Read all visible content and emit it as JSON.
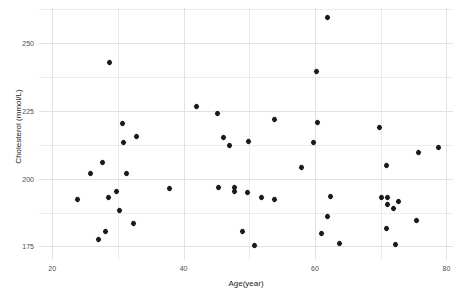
{
  "chart_data": {
    "type": "scatter",
    "title": "",
    "xlabel": "Age(year)",
    "ylabel": "Cholesterol (mmol/L)",
    "xlim": [
      18,
      81
    ],
    "ylim": [
      170,
      263
    ],
    "xticks": [
      20,
      40,
      60,
      80
    ],
    "yticks": [
      175,
      200,
      225,
      250
    ],
    "xticklabels": [
      "20",
      "40",
      "60",
      "80"
    ],
    "yticklabels": [
      "175",
      "200",
      "225",
      "250"
    ],
    "xminor": [
      30,
      50,
      70
    ],
    "yminor": [
      187.5,
      212.5,
      237.5,
      262.5
    ],
    "grid": true,
    "legend": false,
    "marker": "diamond",
    "marker_color": "#1a1a1a",
    "marker_size": 5,
    "series": [
      {
        "name": "patients",
        "points": [
          {
            "x": 28.8,
            "y": 242.8
          },
          {
            "x": 23.9,
            "y": 192.5
          },
          {
            "x": 25.8,
            "y": 201.8
          },
          {
            "x": 27.7,
            "y": 205.8
          },
          {
            "x": 27.1,
            "y": 177.5
          },
          {
            "x": 28.1,
            "y": 180.4
          },
          {
            "x": 28.5,
            "y": 192.9
          },
          {
            "x": 29.8,
            "y": 195.2
          },
          {
            "x": 30.2,
            "y": 188.1
          },
          {
            "x": 30.7,
            "y": 220.2
          },
          {
            "x": 30.9,
            "y": 213.3
          },
          {
            "x": 31.3,
            "y": 201.8
          },
          {
            "x": 32.4,
            "y": 183.3
          },
          {
            "x": 32.8,
            "y": 215.6
          },
          {
            "x": 37.8,
            "y": 196.4
          },
          {
            "x": 42.0,
            "y": 226.6
          },
          {
            "x": 45.2,
            "y": 224.2
          },
          {
            "x": 46.1,
            "y": 215.1
          },
          {
            "x": 47.0,
            "y": 212.3
          },
          {
            "x": 49.9,
            "y": 213.9
          },
          {
            "x": 45.3,
            "y": 196.8
          },
          {
            "x": 47.8,
            "y": 196.8
          },
          {
            "x": 47.8,
            "y": 195.2
          },
          {
            "x": 49.8,
            "y": 194.8
          },
          {
            "x": 48.9,
            "y": 180.4
          },
          {
            "x": 50.8,
            "y": 175.4
          },
          {
            "x": 53.8,
            "y": 221.9
          },
          {
            "x": 51.9,
            "y": 192.9
          },
          {
            "x": 53.9,
            "y": 192.5
          },
          {
            "x": 58.0,
            "y": 204.2
          },
          {
            "x": 59.8,
            "y": 213.3
          },
          {
            "x": 60.2,
            "y": 239.4
          },
          {
            "x": 61.9,
            "y": 259.5
          },
          {
            "x": 60.4,
            "y": 220.6
          },
          {
            "x": 62.3,
            "y": 193.3
          },
          {
            "x": 61.9,
            "y": 186.1
          },
          {
            "x": 61.0,
            "y": 179.6
          },
          {
            "x": 63.8,
            "y": 176.2
          },
          {
            "x": 69.8,
            "y": 219.0
          },
          {
            "x": 70.9,
            "y": 205.0
          },
          {
            "x": 70.1,
            "y": 192.9
          },
          {
            "x": 71.1,
            "y": 192.9
          },
          {
            "x": 71.1,
            "y": 190.5
          },
          {
            "x": 72.0,
            "y": 188.9
          },
          {
            "x": 72.7,
            "y": 191.7
          },
          {
            "x": 70.9,
            "y": 181.5
          },
          {
            "x": 72.3,
            "y": 175.8
          },
          {
            "x": 75.8,
            "y": 209.7
          },
          {
            "x": 75.4,
            "y": 184.5
          },
          {
            "x": 78.8,
            "y": 211.7
          }
        ]
      }
    ]
  }
}
